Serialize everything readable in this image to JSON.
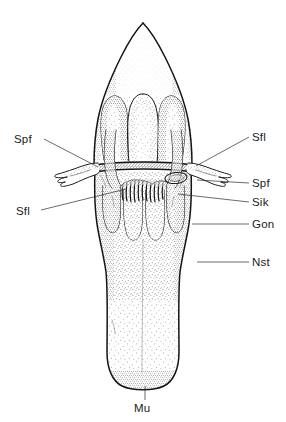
{
  "figure": {
    "style": "stippled scientific illustration, black ink on white",
    "background_color": "#ffffff",
    "ink_color": "#141414",
    "leader_color": "#2b2b2b"
  },
  "labels": {
    "left": [
      {
        "id": "spf-left",
        "text": "Spf",
        "text_x": 14,
        "text_y": 143,
        "leader_from_x": 44,
        "leader_from_y": 139,
        "leader_to_x": 98,
        "leader_to_y": 167
      },
      {
        "id": "sfl-left",
        "text": "Sfl",
        "text_x": 16,
        "text_y": 215,
        "leader_from_x": 41,
        "leader_from_y": 210,
        "leader_to_x": 126,
        "leader_to_y": 189
      }
    ],
    "right": [
      {
        "id": "sfl-right",
        "text": "Sfl",
        "text_x": 252,
        "text_y": 141,
        "leader_from_x": 249,
        "leader_from_y": 137,
        "leader_to_x": 196,
        "leader_to_y": 166
      },
      {
        "id": "spf-right",
        "text": "Spf",
        "text_x": 252,
        "text_y": 187,
        "leader_from_x": 249,
        "leader_from_y": 183,
        "leader_to_x": 197,
        "leader_to_y": 180
      },
      {
        "id": "sik-right",
        "text": "Sik",
        "text_x": 252,
        "text_y": 206,
        "leader_from_x": 249,
        "leader_from_y": 202,
        "leader_to_x": 178,
        "leader_to_y": 194
      },
      {
        "id": "gon-right",
        "text": "Gon",
        "text_x": 252,
        "text_y": 228,
        "leader_from_x": 249,
        "leader_from_y": 224,
        "leader_to_x": 192,
        "leader_to_y": 224
      },
      {
        "id": "nst-right",
        "text": "Nst",
        "text_x": 252,
        "text_y": 266,
        "leader_from_x": 249,
        "leader_from_y": 262,
        "leader_to_x": 197,
        "leader_to_y": 262
      }
    ],
    "bottom": [
      {
        "id": "mu-bottom",
        "text": "Mu",
        "text_x": 134,
        "text_y": 412,
        "leader_from_x": 145,
        "leader_from_y": 400,
        "leader_to_x": 145,
        "leader_to_y": 385
      }
    ]
  },
  "abbreviations": [
    {
      "code": "Spf",
      "occurrences": 2
    },
    {
      "code": "Sfl",
      "occurrences": 2
    },
    {
      "code": "Sik",
      "occurrences": 1
    },
    {
      "code": "Gon",
      "occurrences": 1
    },
    {
      "code": "Nst",
      "occurrences": 1
    },
    {
      "code": "Mu",
      "occurrences": 1
    }
  ],
  "structures": {
    "apex": "pointed dome-shaped apical region with dense stippling",
    "upper_lobes_count": 4,
    "lower_lobes_count": 4,
    "lateral_projections": 2,
    "central_comb": "toothed comb-like central structure",
    "base": "rounded terminal base"
  }
}
